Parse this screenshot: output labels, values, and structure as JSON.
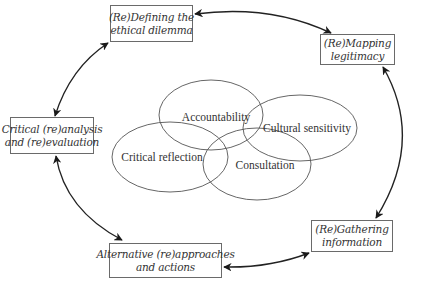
{
  "diagram": {
    "type": "cyclic-process-with-core-principles",
    "cycle_steps": [
      {
        "id": "defining",
        "line1": "(Re)Defining the",
        "line2": "ethical dilemma"
      },
      {
        "id": "mapping",
        "line1": "(Re)Mapping",
        "line2": "legitimacy"
      },
      {
        "id": "gathering",
        "line1": "(Re)Gathering",
        "line2": "information"
      },
      {
        "id": "alternative",
        "line1": "Alternative (re)approaches",
        "line2": "and actions"
      },
      {
        "id": "critical",
        "line1": "Critical (re)analysis",
        "line2": "and (re)evaluation"
      }
    ],
    "core_principles": [
      {
        "id": "accountability",
        "label": "Accountability"
      },
      {
        "id": "cultural",
        "label": "Cultural sensitivity"
      },
      {
        "id": "reflection",
        "label": "Critical reflection"
      },
      {
        "id": "consultation",
        "label": "Consultation"
      }
    ],
    "connectors": "double-headed curved arrows between consecutive steps",
    "colors": {
      "stroke": "#2a2a2a",
      "box_border": "#6a6a6a",
      "text": "#333333"
    }
  }
}
